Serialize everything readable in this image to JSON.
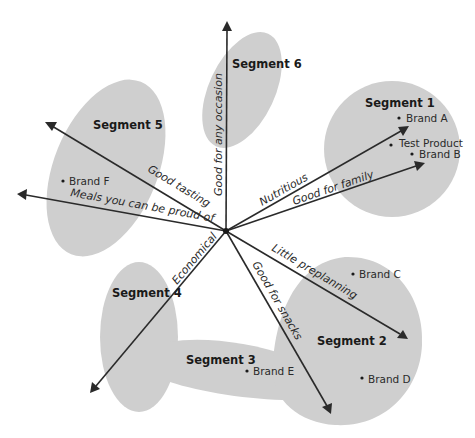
{
  "diagram": {
    "type": "perceptual-map",
    "center": {
      "x": 226,
      "y": 231
    },
    "colors": {
      "segment_fill": "#cfcfcf",
      "line": "#2a2a2a",
      "text": "#1a1a1a"
    },
    "segments": [
      {
        "id": 1,
        "label": "Segment 1"
      },
      {
        "id": 2,
        "label": "Segment 2"
      },
      {
        "id": 3,
        "label": "Segment 3"
      },
      {
        "id": 4,
        "label": "Segment 4"
      },
      {
        "id": 5,
        "label": "Segment 5"
      },
      {
        "id": 6,
        "label": "Segment 6"
      }
    ],
    "brands": [
      {
        "label": "Brand A",
        "segment": "Segment 1"
      },
      {
        "label": "Test Product",
        "segment": "Segment 1"
      },
      {
        "label": "Brand B",
        "segment": "Segment 1"
      },
      {
        "label": "Brand C",
        "segment": "Segment 2"
      },
      {
        "label": "Brand D",
        "segment": "Segment 2"
      },
      {
        "label": "Brand E",
        "segment": "Segment 3"
      },
      {
        "label": "Brand F",
        "segment": "Segment 5"
      }
    ],
    "attributes": [
      {
        "label": "Good for any occasion"
      },
      {
        "label": "Good tasting"
      },
      {
        "label": "Meals you can be proud of"
      },
      {
        "label": "Economical"
      },
      {
        "label": "Good for snacks"
      },
      {
        "label": "Little preplanning"
      },
      {
        "label": "Good for family"
      },
      {
        "label": "Nutritious"
      }
    ]
  }
}
